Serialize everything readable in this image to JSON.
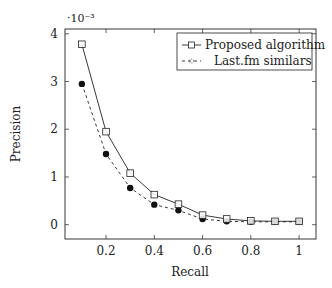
{
  "chart_data": {
    "type": "line",
    "title": "",
    "xlabel": "Recall",
    "ylabel": "Precision",
    "y_scale_label": "·10⁻³",
    "xlim": [
      0.03,
      1.07
    ],
    "ylim": [
      -0.3,
      4.1
    ],
    "x_ticks": [
      0.2,
      0.4,
      0.6,
      0.8,
      1
    ],
    "x_tick_labels": [
      "0.2",
      "0.4",
      "0.6",
      "0.8",
      "1"
    ],
    "y_ticks": [
      0,
      1,
      2,
      3,
      4
    ],
    "y_tick_labels": [
      "0",
      "1",
      "2",
      "3",
      "4"
    ],
    "grid": false,
    "legend_position": "upper right",
    "x": [
      0.1,
      0.2,
      0.3,
      0.4,
      0.5,
      0.6,
      0.7,
      0.8,
      0.9,
      1.0
    ],
    "series": [
      {
        "name": "Proposed algorithm",
        "style": "solid",
        "marker": "open-square",
        "values": [
          3.78,
          1.95,
          1.08,
          0.63,
          0.43,
          0.2,
          0.12,
          0.08,
          0.07,
          0.07
        ]
      },
      {
        "name": "Last.fm similars",
        "style": "dashed",
        "marker": "filled-circle",
        "values": [
          2.95,
          1.48,
          0.77,
          0.42,
          0.3,
          0.12,
          0.07,
          0.06,
          0.06,
          0.06
        ]
      }
    ]
  }
}
